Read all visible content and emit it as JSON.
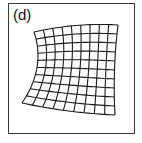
{
  "panel": {
    "label": "(d)"
  },
  "mesh": {
    "description": "Warped rectangular grid (distorted mesh) with concave left edge",
    "columns": 9,
    "rows": 10,
    "corners": {
      "top_left": [
        34,
        32
      ],
      "top_right": [
        118,
        25
      ],
      "bottom_left": [
        22,
        103
      ],
      "bottom_right": [
        115,
        115
      ]
    },
    "left_edge_bow": 9,
    "top_edge_bow": -3,
    "right_edge_bow": -2,
    "bottom_edge_bow": 2,
    "stroke_color": "#1a1a1a",
    "stroke_width": 1.1
  }
}
